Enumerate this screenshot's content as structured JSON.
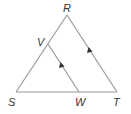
{
  "diagram": {
    "type": "geometry-triangle",
    "points": {
      "R": {
        "label": "R",
        "x": 67,
        "y": 15
      },
      "S": {
        "label": "S",
        "x": 16,
        "y": 92
      },
      "T": {
        "label": "T",
        "x": 117,
        "y": 92
      },
      "V": {
        "label": "V",
        "x": 48,
        "y": 44
      },
      "W": {
        "label": "W",
        "x": 79,
        "y": 92
      }
    },
    "segments": [
      {
        "from": "R",
        "to": "S"
      },
      {
        "from": "R",
        "to": "T",
        "arrow": "parallel-mark"
      },
      {
        "from": "S",
        "to": "T"
      },
      {
        "from": "V",
        "to": "W",
        "arrow": "parallel-mark"
      }
    ],
    "line_color": "#9a9a9a",
    "label_color": "#333333"
  }
}
